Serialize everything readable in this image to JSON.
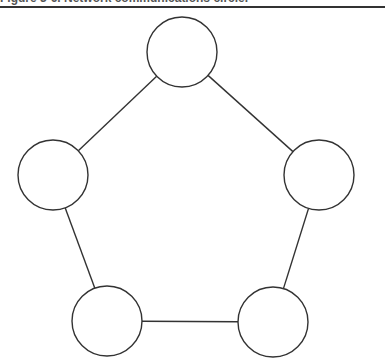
{
  "caption": {
    "text": "Figure 3-6. Network communications circle."
  },
  "diagram": {
    "title": "Network communications circle",
    "stroke_color": "#333333",
    "fill_color": "#ffffff",
    "node_radius": 35,
    "nodes": [
      {
        "id": "top",
        "cx": 182,
        "cy": 52
      },
      {
        "id": "right",
        "cx": 319,
        "cy": 175
      },
      {
        "id": "bottom-right",
        "cx": 273,
        "cy": 322
      },
      {
        "id": "bottom-left",
        "cx": 107,
        "cy": 321
      },
      {
        "id": "left",
        "cx": 53,
        "cy": 175
      }
    ],
    "edges": [
      [
        "top",
        "right"
      ],
      [
        "right",
        "bottom-right"
      ],
      [
        "bottom-right",
        "bottom-left"
      ],
      [
        "bottom-left",
        "left"
      ],
      [
        "left",
        "top"
      ]
    ]
  }
}
